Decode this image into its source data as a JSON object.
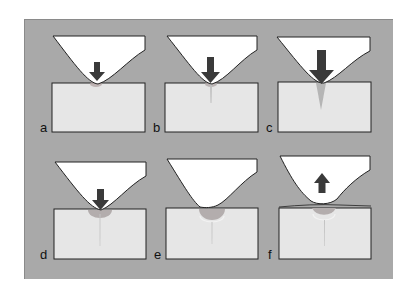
{
  "figure": {
    "background_color": "#a9a9a9",
    "indenter_color": "#ffffff",
    "substrate_color": "#e6e6e6",
    "arrow_color": "#3a3a3a",
    "damage_color": "#b8b8b8",
    "panels": [
      {
        "label": "a",
        "arrow": "down",
        "arrow_size": "small",
        "crack": "none",
        "damage": "small"
      },
      {
        "label": "b",
        "arrow": "down",
        "arrow_size": "medium",
        "crack": "short",
        "damage": "small"
      },
      {
        "label": "c",
        "arrow": "down",
        "arrow_size": "large",
        "crack": "wedge",
        "damage": "small"
      },
      {
        "label": "d",
        "arrow": "down",
        "arrow_size": "small",
        "crack": "long",
        "damage": "medium"
      },
      {
        "label": "e",
        "arrow": "none",
        "arrow_size": "",
        "crack": "long",
        "damage": "large"
      },
      {
        "label": "f",
        "arrow": "up",
        "arrow_size": "small",
        "crack": "long",
        "damage": "large"
      }
    ]
  }
}
